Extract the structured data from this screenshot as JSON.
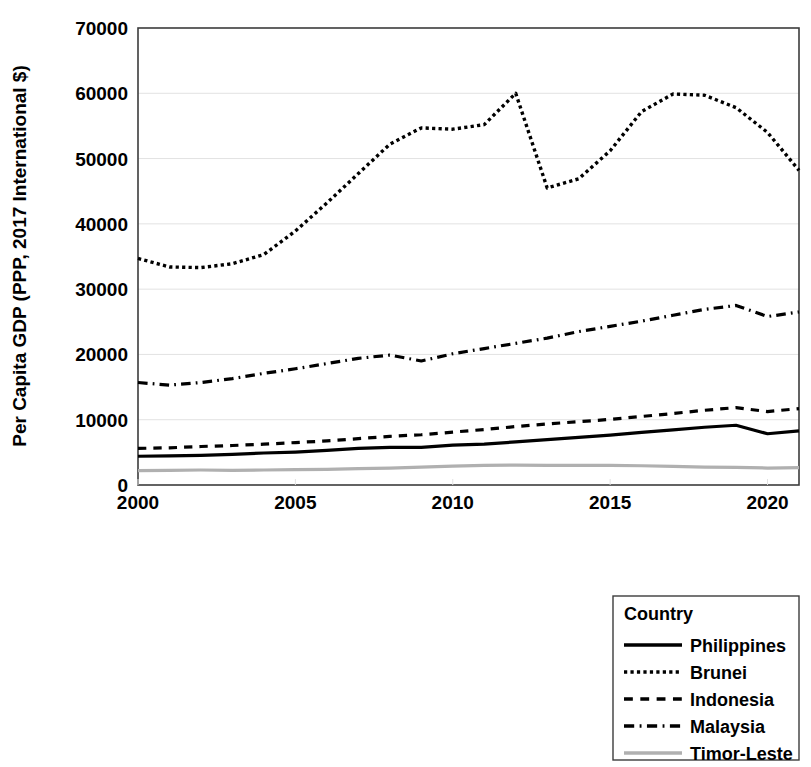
{
  "chart_data": {
    "type": "line",
    "title": "",
    "xlabel": "",
    "ylabel": "Per Capita GDP (PPP, 2017 International $)",
    "xlim": [
      2000,
      2021
    ],
    "ylim": [
      0,
      70000
    ],
    "x_ticks": [
      "2000",
      "2005",
      "2010",
      "2015",
      "2020"
    ],
    "x_tick_values": [
      2000,
      2005,
      2010,
      2015,
      2020
    ],
    "y_ticks": [
      "0",
      "10000",
      "20000",
      "30000",
      "40000",
      "50000",
      "60000",
      "70000"
    ],
    "y_tick_values": [
      0,
      10000,
      20000,
      30000,
      40000,
      50000,
      60000,
      70000
    ],
    "grid": "horizontal",
    "legend_position": "below-right",
    "legend_title": "Country",
    "x": [
      2000,
      2001,
      2002,
      2003,
      2004,
      2005,
      2006,
      2007,
      2008,
      2009,
      2010,
      2011,
      2012,
      2013,
      2014,
      2015,
      2016,
      2017,
      2018,
      2019,
      2020,
      2021
    ],
    "series": [
      {
        "name": "Philippines",
        "style": "solid",
        "color": "#000000",
        "width": 3.2,
        "values": [
          4400,
          4450,
          4550,
          4700,
          4900,
          5050,
          5300,
          5600,
          5750,
          5750,
          6100,
          6250,
          6600,
          6950,
          7300,
          7650,
          8050,
          8450,
          8850,
          9150,
          7850,
          8300
        ]
      },
      {
        "name": "Brunei",
        "style": "dotted",
        "color": "#000000",
        "width": 3.4,
        "values": [
          34700,
          33400,
          33300,
          33900,
          35300,
          38900,
          43200,
          47700,
          52200,
          54700,
          54500,
          55200,
          60000,
          45500,
          46900,
          51200,
          57200,
          59900,
          59700,
          57800,
          54000,
          48200
        ]
      },
      {
        "name": "Indonesia",
        "style": "dashed",
        "color": "#000000",
        "width": 3.2,
        "values": [
          5600,
          5700,
          5900,
          6050,
          6250,
          6500,
          6750,
          7100,
          7450,
          7700,
          8100,
          8500,
          8950,
          9350,
          9700,
          10050,
          10500,
          10950,
          11450,
          11850,
          11250,
          11700
        ]
      },
      {
        "name": "Malaysia",
        "style": "dashdot",
        "color": "#000000",
        "width": 3.2,
        "values": [
          15700,
          15300,
          15700,
          16300,
          17100,
          17800,
          18600,
          19400,
          19900,
          19000,
          20100,
          20900,
          21700,
          22500,
          23500,
          24300,
          25100,
          26000,
          26900,
          27500,
          25800,
          26500
        ]
      },
      {
        "name": "Timor-Leste",
        "style": "solid",
        "color": "#b0b0b0",
        "width": 3.2,
        "values": [
          2200,
          2250,
          2300,
          2250,
          2300,
          2350,
          2400,
          2500,
          2600,
          2750,
          2900,
          3000,
          3050,
          3000,
          3000,
          3000,
          2950,
          2850,
          2750,
          2700,
          2600,
          2650
        ]
      }
    ]
  },
  "axes": {
    "y_axis_title": "Per Capita GDP (PPP, 2017 International $)"
  },
  "legend": {
    "title": "Country",
    "items": [
      {
        "label": "Philippines",
        "style": "solid",
        "color": "#000000"
      },
      {
        "label": "Brunei",
        "style": "dotted",
        "color": "#000000"
      },
      {
        "label": "Indonesia",
        "style": "dashed",
        "color": "#000000"
      },
      {
        "label": "Malaysia",
        "style": "dashdot",
        "color": "#000000"
      },
      {
        "label": "Timor-Leste",
        "style": "solid",
        "color": "#b0b0b0"
      }
    ]
  }
}
